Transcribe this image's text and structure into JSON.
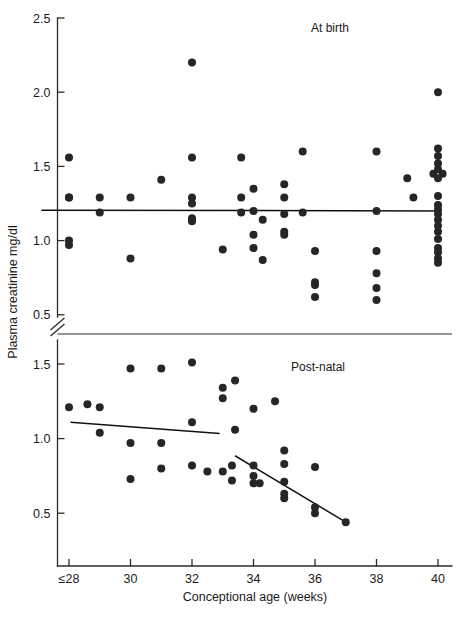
{
  "chart_data": {
    "type": "scatter",
    "title": "",
    "xlabel": "Conceptional age (weeks)",
    "ylabel": "Plasma creatinine mg/dl",
    "xlim": [
      27,
      41
    ],
    "grid": false,
    "legend_position": "none",
    "axis_break": true,
    "x_ticks": [
      {
        "value": 28,
        "label": "≤28"
      },
      {
        "value": 30,
        "label": "30"
      },
      {
        "value": 32,
        "label": "32"
      },
      {
        "value": 34,
        "label": "34"
      },
      {
        "value": 36,
        "label": "36"
      },
      {
        "value": 38,
        "label": "38"
      },
      {
        "value": 40,
        "label": "40"
      }
    ],
    "panels": [
      {
        "name": "at-birth",
        "title": "At birth",
        "ylim": [
          0.5,
          2.5
        ],
        "y_ticks": [
          {
            "value": 0.5,
            "label": "0.5"
          },
          {
            "value": 1.0,
            "label": "1.0"
          },
          {
            "value": 1.5,
            "label": "1.5"
          },
          {
            "value": 2.0,
            "label": "2.0"
          },
          {
            "value": 2.5,
            "label": "2.5"
          }
        ],
        "trend_lines": [
          {
            "name": "at-birth-regression",
            "x1": 27.1,
            "y1": 1.205,
            "x2": 40.1,
            "y2": 1.2
          }
        ],
        "points": [
          {
            "x": 28,
            "y": 1.56
          },
          {
            "x": 28,
            "y": 1.29
          },
          {
            "x": 28,
            "y": 1.29
          },
          {
            "x": 28,
            "y": 1.0
          },
          {
            "x": 28,
            "y": 0.97
          },
          {
            "x": 29,
            "y": 1.29
          },
          {
            "x": 29,
            "y": 1.19
          },
          {
            "x": 30,
            "y": 1.29
          },
          {
            "x": 30,
            "y": 0.88
          },
          {
            "x": 31,
            "y": 1.41
          },
          {
            "x": 32,
            "y": 2.2
          },
          {
            "x": 32,
            "y": 1.56
          },
          {
            "x": 32,
            "y": 1.29
          },
          {
            "x": 32,
            "y": 1.25
          },
          {
            "x": 32,
            "y": 1.15
          },
          {
            "x": 32,
            "y": 1.14
          },
          {
            "x": 32,
            "y": 1.13
          },
          {
            "x": 33,
            "y": 0.94
          },
          {
            "x": 33.6,
            "y": 1.56
          },
          {
            "x": 33.6,
            "y": 1.29
          },
          {
            "x": 33.6,
            "y": 1.19
          },
          {
            "x": 34,
            "y": 1.35
          },
          {
            "x": 34,
            "y": 1.2
          },
          {
            "x": 34,
            "y": 1.04
          },
          {
            "x": 34,
            "y": 0.95
          },
          {
            "x": 34.3,
            "y": 1.14
          },
          {
            "x": 34.3,
            "y": 0.87
          },
          {
            "x": 35,
            "y": 1.38
          },
          {
            "x": 35,
            "y": 1.29
          },
          {
            "x": 35,
            "y": 1.18
          },
          {
            "x": 35,
            "y": 1.06
          },
          {
            "x": 35,
            "y": 1.04
          },
          {
            "x": 35.6,
            "y": 1.6
          },
          {
            "x": 35.6,
            "y": 1.19
          },
          {
            "x": 36,
            "y": 0.93
          },
          {
            "x": 36,
            "y": 0.72
          },
          {
            "x": 36,
            "y": 0.7
          },
          {
            "x": 36,
            "y": 0.62
          },
          {
            "x": 38,
            "y": 1.6
          },
          {
            "x": 38,
            "y": 1.2
          },
          {
            "x": 38,
            "y": 0.93
          },
          {
            "x": 38,
            "y": 0.78
          },
          {
            "x": 38,
            "y": 0.68
          },
          {
            "x": 38,
            "y": 0.6
          },
          {
            "x": 39,
            "y": 1.42
          },
          {
            "x": 39.2,
            "y": 1.29
          },
          {
            "x": 40,
            "y": 2.0
          },
          {
            "x": 40,
            "y": 1.62
          },
          {
            "x": 40,
            "y": 1.57
          },
          {
            "x": 40,
            "y": 1.52
          },
          {
            "x": 40,
            "y": 1.48
          },
          {
            "x": 39.85,
            "y": 1.45
          },
          {
            "x": 40.15,
            "y": 1.45
          },
          {
            "x": 40,
            "y": 1.42
          },
          {
            "x": 40,
            "y": 1.3
          },
          {
            "x": 40,
            "y": 1.24
          },
          {
            "x": 40,
            "y": 1.21
          },
          {
            "x": 40,
            "y": 1.18
          },
          {
            "x": 40,
            "y": 1.14
          },
          {
            "x": 40,
            "y": 1.1
          },
          {
            "x": 40,
            "y": 1.06
          },
          {
            "x": 40,
            "y": 1.01
          },
          {
            "x": 40,
            "y": 0.95
          },
          {
            "x": 40,
            "y": 0.92
          },
          {
            "x": 40,
            "y": 0.88
          },
          {
            "x": 40,
            "y": 0.85
          }
        ]
      },
      {
        "name": "post-natal",
        "title": "Post-natal",
        "ylim": [
          0.35,
          1.62
        ],
        "y_ticks": [
          {
            "value": 0.5,
            "label": "0.5"
          },
          {
            "value": 1.0,
            "label": "1.0"
          },
          {
            "value": 1.5,
            "label": "1.5"
          }
        ],
        "trend_lines": [
          {
            "name": "post-natal-regression-early",
            "x1": 28.05,
            "y1": 1.11,
            "x2": 32.9,
            "y2": 1.035
          },
          {
            "name": "post-natal-regression-late",
            "x1": 33.4,
            "y1": 0.885,
            "x2": 37.0,
            "y2": 0.44
          }
        ],
        "points": [
          {
            "x": 28,
            "y": 1.21
          },
          {
            "x": 28.6,
            "y": 1.23
          },
          {
            "x": 29,
            "y": 1.21
          },
          {
            "x": 29,
            "y": 1.04
          },
          {
            "x": 30,
            "y": 1.47
          },
          {
            "x": 30,
            "y": 0.97
          },
          {
            "x": 30,
            "y": 0.73
          },
          {
            "x": 31,
            "y": 1.47
          },
          {
            "x": 31,
            "y": 0.97
          },
          {
            "x": 31,
            "y": 0.8
          },
          {
            "x": 32,
            "y": 1.51
          },
          {
            "x": 32,
            "y": 1.11
          },
          {
            "x": 32,
            "y": 0.82
          },
          {
            "x": 32.5,
            "y": 0.78
          },
          {
            "x": 33,
            "y": 1.34
          },
          {
            "x": 33,
            "y": 1.27
          },
          {
            "x": 33,
            "y": 0.78
          },
          {
            "x": 33.4,
            "y": 1.39
          },
          {
            "x": 34,
            "y": 1.2
          },
          {
            "x": 33.4,
            "y": 1.06
          },
          {
            "x": 33.3,
            "y": 0.82
          },
          {
            "x": 33.3,
            "y": 0.72
          },
          {
            "x": 34,
            "y": 0.82
          },
          {
            "x": 34,
            "y": 0.75
          },
          {
            "x": 34,
            "y": 0.7
          },
          {
            "x": 34.2,
            "y": 0.7
          },
          {
            "x": 34.7,
            "y": 1.25
          },
          {
            "x": 35,
            "y": 0.92
          },
          {
            "x": 35,
            "y": 0.83
          },
          {
            "x": 35,
            "y": 0.71
          },
          {
            "x": 35,
            "y": 0.63
          },
          {
            "x": 35,
            "y": 0.6
          },
          {
            "x": 36,
            "y": 0.81
          },
          {
            "x": 36,
            "y": 0.54
          },
          {
            "x": 36,
            "y": 0.5
          },
          {
            "x": 37,
            "y": 0.44
          }
        ]
      }
    ]
  },
  "geometry": {
    "plot_left": 57.5,
    "plot_right": 452,
    "x_tick_start": 69,
    "x_tick_step": 61.5,
    "top_axis_y_top": 18,
    "top_axis_y_bottom": 317,
    "top_tick_2_5": 18,
    "top_tick_step": 74.2,
    "bottom_axis_y_top": 340,
    "bottom_axis_y_bottom": 566,
    "bottom_tick_1_5": 364,
    "bottom_tick_step": 74.6,
    "divider_y": 334,
    "break_y_center": 326,
    "point_radius": 4.0
  }
}
